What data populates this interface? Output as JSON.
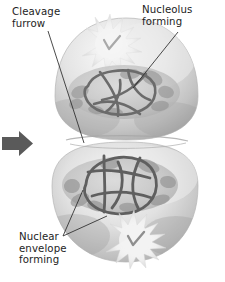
{
  "figure": {
    "background_color": "#ffffff",
    "width": 225,
    "height": 282
  },
  "labels": {
    "cleavage_furrow": "Cleavage\nfurrow",
    "nucleolus_forming": "Nucleolus\nforming",
    "nuclear_envelope_forming": "Nuclear\nenvelope\nforming"
  },
  "colors": {
    "text": "#1d1d1d",
    "leader_line": "#2b2b2b",
    "arrow": "#555555",
    "cell_light": "#f2f2f2",
    "cell_mid": "#c9c9c9",
    "cell_shadow": "#9a9a9a",
    "nucleus_fill": "#bfbfbf",
    "chromatin": "#6e6e6e",
    "nucleolus": "#eeeeee"
  },
  "structures": {
    "progression_arrow": "arrow-right-icon",
    "upper_cell": "daughter-cell-upper",
    "lower_cell": "daughter-cell-lower",
    "upper_nucleolus": "nucleolus-starburst-upper",
    "lower_nucleolus": "nucleolus-starburst-lower",
    "upper_chromatin": "chromatin-tangle-upper",
    "lower_chromatin": "chromatin-tangle-lower"
  }
}
